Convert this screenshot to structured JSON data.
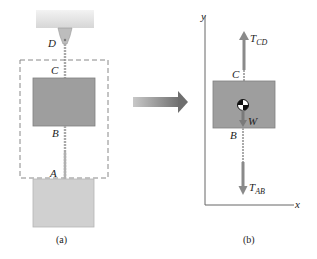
{
  "figure_a": {
    "caption": "(a)",
    "labels": {
      "D": "D",
      "C": "C",
      "B": "B",
      "A": "A"
    },
    "colors": {
      "block": "#9e9e9e",
      "block_light": "#cfcfcf",
      "ceiling": "#e4e4e4",
      "cable": "#a8a8a8",
      "dashed_box": "#888888"
    }
  },
  "arrow": {
    "color": "#8a8a8a"
  },
  "figure_b": {
    "caption": "(b)",
    "axes": {
      "x": "x",
      "y": "y"
    },
    "labels": {
      "C": "C",
      "B": "B",
      "W": "W"
    },
    "forces": {
      "T_CD": {
        "main": "T",
        "sub": "CD"
      },
      "T_AB": {
        "main": "T",
        "sub": "AB"
      }
    },
    "colors": {
      "force_arrow": "#8a8a8a",
      "block": "#9e9e9e"
    }
  }
}
